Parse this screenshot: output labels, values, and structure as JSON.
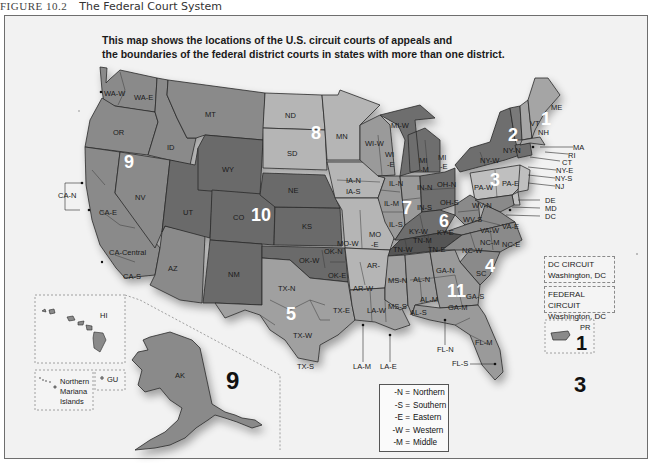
{
  "figure": {
    "number": "FIGURE 10.2",
    "title": "The Federal Court System"
  },
  "subtitle": {
    "line1": "This map shows the locations of the U.S. circuit courts of appeals and",
    "line2": "the boundaries of the federal district courts in states with more than one district."
  },
  "circuits": {
    "c1": "1",
    "c2": "2",
    "c3": "3",
    "c4": "4",
    "c5": "5",
    "c6": "6",
    "c7": "7",
    "c8": "8",
    "c9": "9",
    "c10": "10",
    "c11": "11",
    "c9_ak": "9",
    "c3_pr": "3",
    "c1_pr": "1"
  },
  "districts": {
    "wa_w": "WA-W",
    "wa_e": "WA-E",
    "or": "OR",
    "id": "ID",
    "mt": "MT",
    "ca_n": "CA-N",
    "ca_e": "CA-E",
    "ca_central": "CA-Central",
    "ca_s": "CA-S",
    "nv": "NV",
    "ut": "UT",
    "az": "AZ",
    "wy": "WY",
    "co": "CO",
    "nm": "NM",
    "nd": "ND",
    "sd": "SD",
    "ne": "NE",
    "ks": "KS",
    "mn": "MN",
    "ok_n": "OK-N",
    "ok_w": "OK-W",
    "ok_e": "OK-E",
    "tx_n": "TX-N",
    "tx_w": "TX-W",
    "tx_e": "TX-E",
    "tx_s": "TX-S",
    "ia_n": "IA-N",
    "ia_s": "IA-S",
    "mo_w": "MO-W",
    "mo_e": "MO\n-E",
    "ar_w": "AR-W",
    "ar_e": "AR-",
    "la_w": "LA-W",
    "la_m": "LA-M",
    "la_e": "LA-E",
    "wi_w": "WI-W",
    "wi_e": "WI\n-E",
    "mi_w": "MI-W",
    "mi_m": "MI\n-M",
    "mi_e": "MI\n-E",
    "il_n": "IL-N",
    "il_m": "IL-M",
    "il_s": "IL-S",
    "in_n": "IN-N",
    "in_s": "IN-S",
    "oh_n": "OH-N",
    "oh_s": "OH-S",
    "ky_w": "KY-W",
    "ky_e": "KY-E",
    "tn_w": "TN-W",
    "tn_m": "TN-M",
    "tn_e": "TN-E",
    "ms_n": "MS-N",
    "ms_s": "MS-S",
    "al_n": "AL-N",
    "al_m": "AL-M",
    "al_s": "AL-S",
    "ga_n": "GA-N",
    "ga_m": "GA-M",
    "ga_s": "GA-S",
    "fl_n": "FL-N",
    "fl_m": "FL-M",
    "fl_s": "FL-S",
    "sc": "SC",
    "nc_w": "NC-W",
    "nc_m": "NC-M",
    "nc_e": "NC-E",
    "va_w": "VA-W",
    "va_e": "VA-E",
    "wv_n": "WV-N",
    "wv_s": "WV-S",
    "pa_w": "PA-W",
    "pa_e": "PA-E",
    "ny_w": "NY-W",
    "ny_n": "NY-N",
    "vt": "VT",
    "nh": "NH",
    "me": "ME",
    "ma": "MA",
    "ri": "RI",
    "ct": "CT",
    "ny_e": "NY-E",
    "ny_s": "NY-S",
    "nj": "NJ",
    "de": "DE",
    "md": "MD",
    "dc": "DC",
    "ak": "AK",
    "hi": "HI",
    "gu": "GU",
    "pr": "PR"
  },
  "insets": {
    "northern_mariana": [
      "Northern",
      "Mariana",
      "Islands"
    ],
    "guam": "GU",
    "hawaii": "HI",
    "dc_circuit": {
      "name": "DC CIRCUIT",
      "location": "Washington, DC"
    },
    "federal_circuit": {
      "name": "FEDERAL CIRCUIT",
      "location": "Washington, DC"
    }
  },
  "legend": [
    {
      "code": "-N =",
      "meaning": "Northern"
    },
    {
      "code": "-S =",
      "meaning": "Southern"
    },
    {
      "code": "-E =",
      "meaning": "Eastern"
    },
    {
      "code": "-W =",
      "meaning": "Western"
    },
    {
      "code": "-M =",
      "meaning": "Middle"
    }
  ],
  "colors": {
    "background": "#f2f2f2",
    "circuit_dark": "#6a6a6a",
    "circuit_mid": "#8a8a8a",
    "circuit_light": "#b5b5b5",
    "circuit_lighter": "#c4c4c4",
    "border": "#2a2a2a"
  }
}
